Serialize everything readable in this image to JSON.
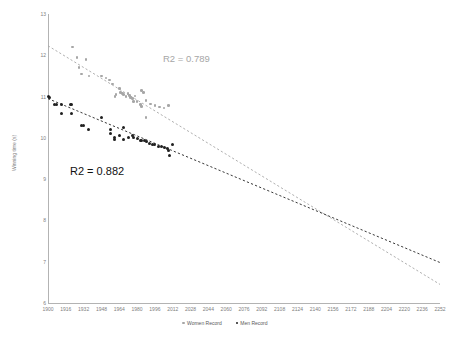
{
  "chart_data": {
    "type": "scatter",
    "title": "",
    "xlabel": "",
    "ylabel": "Winning time (s)",
    "xlim": [
      1900,
      2252
    ],
    "ylim": [
      6,
      13
    ],
    "grid": false,
    "legend_position": "bottom",
    "x_ticks": [
      1900,
      1916,
      1932,
      1948,
      1964,
      1980,
      1996,
      2012,
      2028,
      2044,
      2060,
      2076,
      2092,
      2108,
      2124,
      2140,
      2156,
      2172,
      2188,
      2204,
      2220,
      2236,
      2252
    ],
    "y_ticks": [
      6,
      7,
      8,
      9,
      10,
      11,
      12,
      13
    ],
    "series": [
      {
        "name": "Women Record",
        "color": "#a6a6a6",
        "marker": "circle",
        "points": [
          [
            1922,
            12.2
          ],
          [
            1926,
            11.95
          ],
          [
            1928,
            11.7
          ],
          [
            1930,
            11.55
          ],
          [
            1934,
            11.9
          ],
          [
            1937,
            11.5
          ],
          [
            1948,
            11.5
          ],
          [
            1952,
            11.45
          ],
          [
            1955,
            11.4
          ],
          [
            1958,
            11.3
          ],
          [
            1960,
            11.0
          ],
          [
            1961,
            11.05
          ],
          [
            1964,
            11.2
          ],
          [
            1965,
            11.1
          ],
          [
            1967,
            11.08
          ],
          [
            1968,
            11.05
          ],
          [
            1970,
            11.0
          ],
          [
            1972,
            11.07
          ],
          [
            1973,
            11.02
          ],
          [
            1974,
            10.98
          ],
          [
            1976,
            10.95
          ],
          [
            1977,
            10.88
          ],
          [
            1983,
            10.81
          ],
          [
            1984,
            10.76
          ],
          [
            1988,
            10.49
          ],
          [
            1984,
            11.15
          ],
          [
            1986,
            11.1
          ],
          [
            1988,
            10.9
          ],
          [
            1992,
            10.82
          ],
          [
            1996,
            10.78
          ],
          [
            2000,
            10.75
          ],
          [
            2004,
            10.72
          ],
          [
            2008,
            10.78
          ],
          [
            1980,
            10.88
          ],
          [
            1978,
            11.01
          ]
        ],
        "trendline": {
          "from": [
            1900,
            12.23
          ],
          "to": [
            2252,
            6.45
          ],
          "style": "dashed",
          "r2": 0.789
        }
      },
      {
        "name": "Men Record",
        "color": "#202020",
        "marker": "circle",
        "points": [
          [
            1900,
            11.0
          ],
          [
            1901,
            10.98
          ],
          [
            1906,
            10.8
          ],
          [
            1908,
            10.8
          ],
          [
            1912,
            10.8
          ],
          [
            1920,
            10.8
          ],
          [
            1921,
            10.8
          ],
          [
            1912,
            10.6
          ],
          [
            1921,
            10.6
          ],
          [
            1930,
            10.3
          ],
          [
            1932,
            10.3
          ],
          [
            1936,
            10.2
          ],
          [
            1948,
            10.5
          ],
          [
            1956,
            10.2
          ],
          [
            1956,
            10.1
          ],
          [
            1960,
            10.0
          ],
          [
            1960,
            9.95
          ],
          [
            1964,
            10.06
          ],
          [
            1968,
            9.95
          ],
          [
            1968,
            10.25
          ],
          [
            1972,
            10.0
          ],
          [
            1976,
            10.06
          ],
          [
            1977,
            10.0
          ],
          [
            1980,
            9.98
          ],
          [
            1983,
            9.93
          ],
          [
            1984,
            9.93
          ],
          [
            1987,
            9.93
          ],
          [
            1988,
            9.92
          ],
          [
            1991,
            9.86
          ],
          [
            1994,
            9.85
          ],
          [
            1996,
            9.84
          ],
          [
            1999,
            9.79
          ],
          [
            2002,
            9.78
          ],
          [
            2005,
            9.77
          ],
          [
            2007,
            9.74
          ],
          [
            2008,
            9.69
          ],
          [
            2009,
            9.58
          ],
          [
            2012,
            9.83
          ]
        ],
        "trendline": {
          "from": [
            1900,
            10.95
          ],
          "to": [
            2252,
            6.98
          ],
          "style": "dashed",
          "r2": 0.882
        }
      }
    ],
    "annotations": [
      {
        "text": "R2 = 0.789",
        "color": "#a6a6a6",
        "series": "Women Record"
      },
      {
        "text": "R2 = 0.882",
        "color": "#111111",
        "series": "Men Record"
      }
    ]
  },
  "legend": {
    "items": [
      {
        "label": "Women Record"
      },
      {
        "label": "Men Record"
      }
    ]
  }
}
